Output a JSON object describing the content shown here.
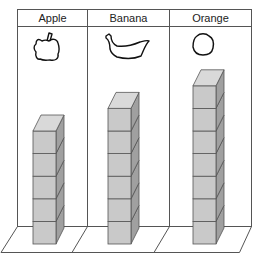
{
  "figure": {
    "type": "pictograph-cube-chart",
    "columns": [
      {
        "label": "Apple",
        "icon": "apple-icon",
        "cubes": 5
      },
      {
        "label": "Banana",
        "icon": "banana-icon",
        "cubes": 6
      },
      {
        "label": "Orange",
        "icon": "orange-icon",
        "cubes": 7
      }
    ],
    "colors": {
      "line": "#555555",
      "cube_front": "#c9c9c9",
      "cube_side": "#a0a0a0",
      "cube_top": "#d9d9d9"
    }
  },
  "chart_data": {
    "type": "bar",
    "title": "",
    "categories": [
      "Apple",
      "Banana",
      "Orange"
    ],
    "values": [
      5,
      6,
      7
    ],
    "xlabel": "",
    "ylabel": "",
    "unit": "cubes",
    "grid": false,
    "legend": null
  }
}
